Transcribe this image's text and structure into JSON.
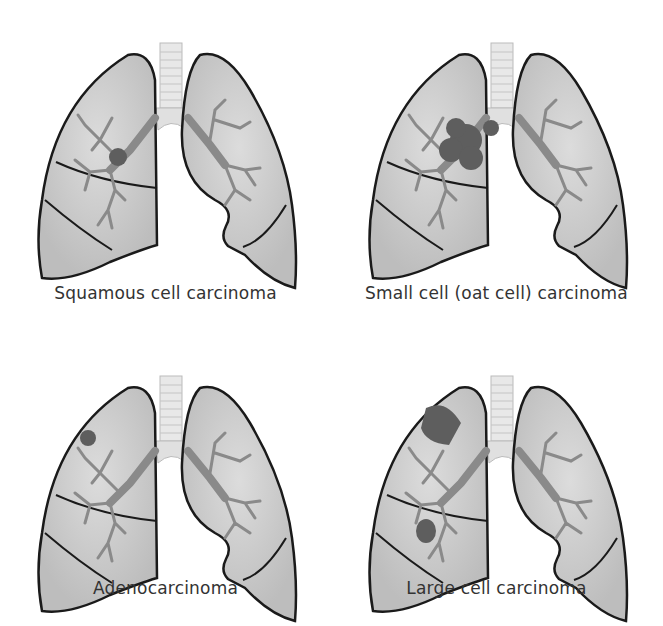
{
  "figure": {
    "colors": {
      "lung_fill": "#c9c9c9",
      "lung_stroke": "#1a1a1a",
      "bronchi": "#8a8a8a",
      "tumor": "#5e5e5e",
      "trachea": "#e6e6e6",
      "background": "#ffffff"
    },
    "panels": [
      {
        "label": "Squamous cell carcinoma",
        "tumor_location": "central, near right main bronchus"
      },
      {
        "label": "Small cell (oat cell) carcinoma",
        "tumor_location": "large central mass at hilum"
      },
      {
        "label": "Adenocarcinoma",
        "tumor_location": "peripheral, right upper lobe"
      },
      {
        "label": "Large cell carcinoma",
        "tumor_location": "peripheral, right upper and middle lobes"
      }
    ]
  }
}
